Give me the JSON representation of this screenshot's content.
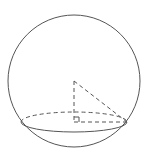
{
  "diagram": {
    "type": "sphere-cross-section",
    "colors": {
      "stroke": "#555555",
      "background": "#ffffff"
    },
    "sphere": {
      "cx": 74,
      "cy": 81,
      "r": 66
    },
    "section_ellipse": {
      "cx": 74,
      "cy": 122,
      "rx": 53,
      "ry": 10
    },
    "apex": {
      "x": 74,
      "y": 81
    },
    "foot": {
      "x": 74,
      "y": 122
    },
    "edge_point": {
      "x": 127,
      "y": 122
    },
    "right_angle_marker": true,
    "labels": []
  }
}
